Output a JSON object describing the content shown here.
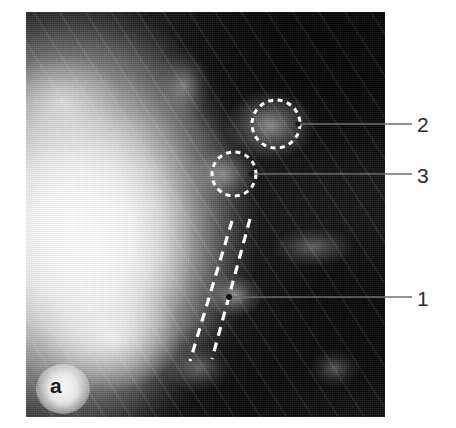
{
  "figure": {
    "panel_letter": "a",
    "kind": "grayscale-radiograph",
    "plate": {
      "x": 26,
      "y": 12,
      "width": 359,
      "height": 405,
      "background_color": "#0a0a0a",
      "page_color": "#ffffff"
    }
  },
  "annotations": {
    "line_color": "#6e6e6e",
    "marker_color": "#ffffff",
    "label_color": "#2b2b2b",
    "items": [
      {
        "id": "1",
        "label": "1",
        "marker": "dashed-tramlines",
        "label_x": 417,
        "label_y": 288,
        "leader": {
          "x1": 229,
          "y1": 297,
          "x2": 412,
          "y2": 297
        },
        "dot": {
          "x": 229,
          "y": 297,
          "r": 3
        }
      },
      {
        "id": "2",
        "label": "2",
        "marker": "dashed-circle-large",
        "label_x": 417,
        "label_y": 114,
        "leader": {
          "x1": 298,
          "y1": 124,
          "x2": 412,
          "y2": 124
        },
        "dot": {
          "x": 298,
          "y": 124,
          "r": 2.5
        },
        "circle": {
          "cx": 276,
          "cy": 124,
          "r": 24
        }
      },
      {
        "id": "3",
        "label": "3",
        "marker": "dashed-circle-small",
        "label_x": 417,
        "label_y": 165,
        "leader": {
          "x1": 251,
          "y1": 174,
          "x2": 412,
          "y2": 174
        },
        "dot": {
          "x": 251,
          "y": 174,
          "r": 2.5
        },
        "circle": {
          "cx": 234,
          "cy": 174,
          "r": 22
        }
      }
    ],
    "tramlines": [
      {
        "x1": 232,
        "y1": 221,
        "x2": 190,
        "y2": 361
      },
      {
        "x1": 250,
        "y1": 219,
        "x2": 212,
        "y2": 359
      }
    ]
  }
}
